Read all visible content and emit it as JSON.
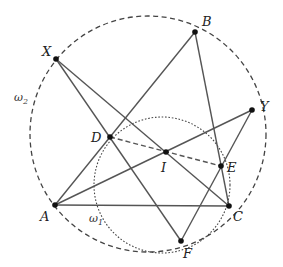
{
  "diagram": {
    "title": "",
    "colors": {
      "line": "#555555",
      "point": "#111111",
      "label": "#222222"
    },
    "points": {
      "X": {
        "label": "X",
        "x": 56,
        "y": 59,
        "lx": 42,
        "ly": 56
      },
      "B": {
        "label": "B",
        "x": 195,
        "y": 32,
        "lx": 202,
        "ly": 26
      },
      "Y": {
        "label": "Y",
        "x": 252,
        "y": 110,
        "lx": 260,
        "ly": 111
      },
      "D": {
        "label": "D",
        "x": 110,
        "y": 137,
        "lx": 91,
        "ly": 142
      },
      "I": {
        "label": "I",
        "x": 166,
        "y": 152,
        "lx": 161,
        "ly": 172
      },
      "E": {
        "label": "E",
        "x": 221,
        "y": 166,
        "lx": 227,
        "ly": 172
      },
      "A": {
        "label": "A",
        "x": 55,
        "y": 205,
        "lx": 40,
        "ly": 221
      },
      "C": {
        "label": "C",
        "x": 229,
        "y": 206,
        "lx": 233,
        "ly": 221
      },
      "F": {
        "label": "F",
        "x": 181,
        "y": 241,
        "lx": 183,
        "ly": 258
      }
    },
    "circles": {
      "omega2": {
        "label": "ω",
        "subscript": "2",
        "cx": 148,
        "cy": 134,
        "r": 118,
        "style": "dashed",
        "lx": 14,
        "ly": 101
      },
      "omega1": {
        "label": "ω",
        "subscript": "1",
        "cx": 162,
        "cy": 185,
        "r": 68,
        "style": "dotted",
        "lx": 89,
        "ly": 222
      }
    },
    "segments": [
      {
        "from": "X",
        "to": "F",
        "style": "solid"
      },
      {
        "from": "X",
        "to": "C",
        "style": "solid"
      },
      {
        "from": "A",
        "to": "B",
        "style": "solid"
      },
      {
        "from": "B",
        "to": "C",
        "style": "solid"
      },
      {
        "from": "A",
        "to": "Y",
        "style": "solid"
      },
      {
        "from": "Y",
        "to": "F",
        "style": "solid"
      },
      {
        "from": "A",
        "to": "C",
        "style": "solid"
      },
      {
        "from": "D",
        "to": "E",
        "style": "dashed"
      }
    ]
  }
}
